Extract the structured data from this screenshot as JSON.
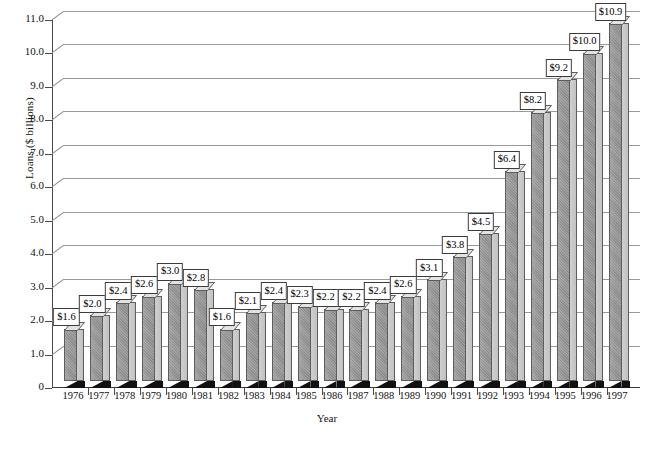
{
  "chart_data": {
    "type": "bar",
    "title": "",
    "xlabel": "Year",
    "ylabel": "Loans ($ billions)",
    "categories": [
      "1976",
      "1977",
      "1978",
      "1979",
      "1980",
      "1981",
      "1982",
      "1983",
      "1984",
      "1985",
      "1986",
      "1987",
      "1988",
      "1989",
      "1990",
      "1991",
      "1992",
      "1993",
      "1994",
      "1995",
      "1996",
      "1997"
    ],
    "values": [
      1.6,
      2.0,
      2.4,
      2.6,
      3.0,
      2.8,
      1.6,
      2.1,
      2.4,
      2.3,
      2.2,
      2.2,
      2.4,
      2.6,
      3.1,
      3.8,
      4.5,
      6.4,
      8.2,
      9.2,
      10.0,
      10.9
    ],
    "data_labels": [
      "$1.6",
      "$2.0",
      "$2.4",
      "$2.6",
      "$3.0",
      "$2.8",
      "$1.6",
      "$2.1",
      "$2.4",
      "$2.3",
      "$2.2",
      "$2.2",
      "$2.4",
      "$2.6",
      "$3.1",
      "$3.8",
      "$4.5",
      "$6.4",
      "$8.2",
      "$9.2",
      "$10.0",
      "$10.9"
    ],
    "ylim": [
      0,
      11.0
    ],
    "ytick_values": [
      0,
      1.0,
      2.0,
      3.0,
      4.0,
      5.0,
      6.0,
      7.0,
      8.0,
      9.0,
      10.0,
      11.0
    ],
    "ytick_labels": [
      "0",
      "1.0",
      "2.0",
      "3.0",
      "4.0",
      "5.0",
      "6.0",
      "7.0",
      "8.0",
      "9.0",
      "10.0",
      "11.0"
    ],
    "grid": true,
    "grid_axis": "y",
    "legend": false,
    "style": "3d-column",
    "colors": {
      "bar_front": "#8f8f8f",
      "bar_side": "#c8c8c8",
      "bar_top": "#e2e2e2",
      "bar_outline": "#5d5d5d",
      "base_shadow": "#111111",
      "gridline": "#9a9a9a",
      "axis": "#4a4a4a",
      "label_box_bg": "#ffffff",
      "label_box_border": "#3b3b3b",
      "background": "#ffffff"
    }
  },
  "caption": ""
}
